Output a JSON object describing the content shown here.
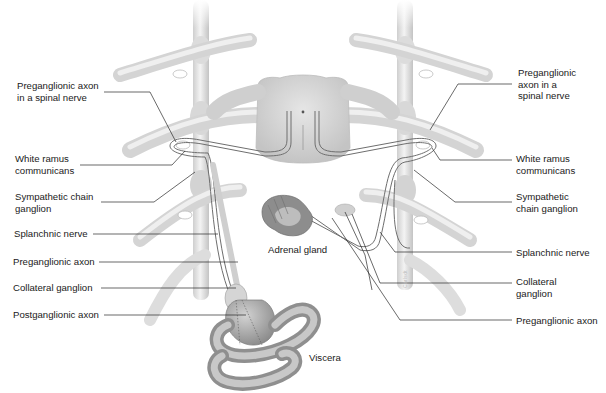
{
  "diagram": {
    "colors": {
      "background": "#ffffff",
      "nerve_fill": "#d9d9d9",
      "nerve_shadow": "#b8b8b8",
      "axon_line": "#6e6e6e",
      "leader_line": "#2a2a2a",
      "label_text": "#1a1a1a",
      "viscera_fill": "#a9a9a9",
      "adrenal_fill": "#8f8f8f"
    },
    "left_labels": [
      {
        "id": "l1",
        "line1": "Preganglionic axon",
        "line2": "in a spinal nerve"
      },
      {
        "id": "l2",
        "line1": "White ramus",
        "line2": "communicans"
      },
      {
        "id": "l3",
        "line1": "Sympathetic chain",
        "line2": "ganglion"
      },
      {
        "id": "l4",
        "line1": "Splanchnic nerve"
      },
      {
        "id": "l5",
        "line1": "Preganglionic axon"
      },
      {
        "id": "l6",
        "line1": "Collateral ganglion"
      },
      {
        "id": "l7",
        "line1": "Postganglionic axon"
      }
    ],
    "right_labels": [
      {
        "id": "r1",
        "line1": "Preganglionic",
        "line2": "axon in a",
        "line3": "spinal nerve"
      },
      {
        "id": "r2",
        "line1": "White ramus",
        "line2": "communicans"
      },
      {
        "id": "r3",
        "line1": "Sympathetic",
        "line2": "chain ganglion"
      },
      {
        "id": "r4",
        "line1": "Splanchnic nerve"
      },
      {
        "id": "r5",
        "line1": "Collateral",
        "line2": "ganglion"
      },
      {
        "id": "r6",
        "line1": "Preganglionic axon"
      }
    ],
    "center_labels": {
      "adrenal": "Adrenal gland",
      "viscera": "Viscera"
    },
    "watermark": "Carlsdt"
  }
}
